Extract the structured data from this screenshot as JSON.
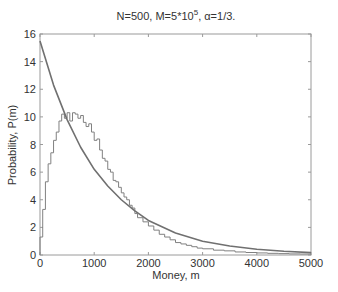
{
  "chart_data": {
    "type": "line",
    "title_parts": {
      "prefix": "N=500, M=5*10",
      "sup": "5",
      "suffix": ", α=1/3."
    },
    "xlabel": "Money, m",
    "ylabel": "Probability, P(m)",
    "xlim": [
      0,
      5000
    ],
    "ylim": [
      0,
      16
    ],
    "xticks": [
      0,
      1000,
      2000,
      3000,
      4000,
      5000
    ],
    "yticks": [
      0,
      2,
      4,
      6,
      8,
      10,
      12,
      14,
      16
    ],
    "grid": false,
    "legend": null,
    "series": [
      {
        "name": "simulation histogram",
        "style": "stairs",
        "color": "#808080",
        "x": [
          0,
          50,
          100,
          150,
          200,
          250,
          300,
          350,
          400,
          450,
          500,
          550,
          600,
          650,
          700,
          750,
          800,
          850,
          900,
          950,
          1000,
          1050,
          1100,
          1150,
          1200,
          1250,
          1300,
          1350,
          1400,
          1450,
          1500,
          1550,
          1600,
          1650,
          1700,
          1750,
          1800,
          1900,
          2000,
          2100,
          2200,
          2300,
          2400,
          2500,
          2600,
          2700,
          2800,
          2900,
          3000,
          3200,
          3400,
          3600,
          3800,
          4000,
          4200,
          4400,
          4600,
          4800,
          5000
        ],
        "y": [
          1.3,
          3.3,
          5.3,
          6.6,
          7.4,
          8.3,
          8.9,
          9.7,
          10.2,
          9.9,
          10.3,
          9.7,
          10.3,
          10.2,
          9.9,
          10.1,
          9.6,
          9.3,
          9.5,
          8.9,
          8.3,
          8.4,
          7.6,
          7.0,
          6.8,
          6.2,
          6.0,
          5.4,
          5.3,
          4.9,
          4.5,
          4.2,
          4.0,
          3.6,
          3.4,
          3.0,
          2.7,
          2.4,
          2.1,
          1.8,
          1.5,
          1.3,
          1.1,
          0.9,
          0.8,
          0.7,
          0.6,
          0.5,
          0.45,
          0.35,
          0.3,
          0.22,
          0.18,
          0.15,
          0.12,
          0.1,
          0.08,
          0.07,
          0.06
        ]
      },
      {
        "name": "exponential fit",
        "style": "line",
        "color": "#707070",
        "x": [
          0,
          250,
          500,
          750,
          1000,
          1250,
          1500,
          1750,
          2000,
          2500,
          3000,
          3500,
          4000,
          4500,
          5000
        ],
        "y": [
          15.5,
          12.3,
          9.8,
          7.8,
          6.2,
          5.0,
          4.0,
          3.2,
          2.5,
          1.6,
          1.0,
          0.65,
          0.42,
          0.27,
          0.17
        ]
      }
    ]
  }
}
